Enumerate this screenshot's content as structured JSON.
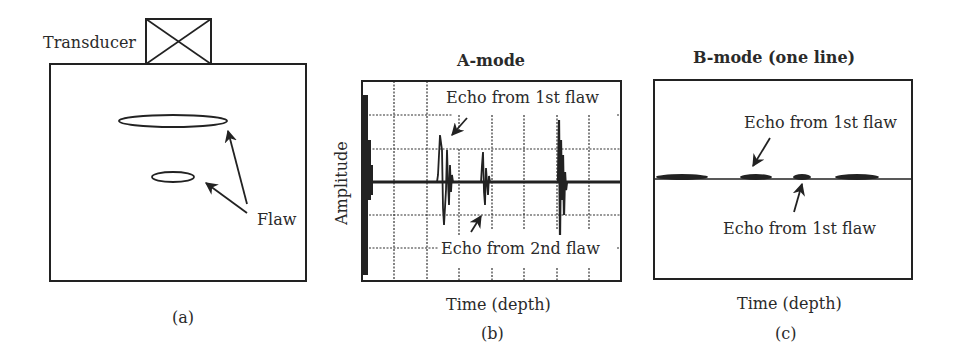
{
  "figure": {
    "panels": [
      {
        "id": "a",
        "caption": "(a)",
        "labels": {
          "transducer": "Transducer",
          "flaw": "Flaw"
        },
        "flaws": [
          {
            "name": "1st flaw",
            "shape": "ellipse",
            "cx": 173,
            "cy": 121,
            "rx": 54,
            "ry": 6
          },
          {
            "name": "2nd flaw",
            "shape": "ellipse",
            "cx": 173,
            "cy": 177,
            "rx": 21,
            "ry": 5
          }
        ]
      },
      {
        "id": "b",
        "caption": "(b)",
        "title": "A-mode",
        "ylabel": "Amplitude",
        "xlabel": "Time (depth)",
        "annotations": {
          "echo1": "Echo from 1st flaw",
          "echo2": "Echo from 2nd flaw"
        }
      },
      {
        "id": "c",
        "caption": "(c)",
        "title": "B-mode (one line)",
        "xlabel": "Time (depth)",
        "annotations": {
          "echo_top": "Echo from 1st flaw",
          "echo_bottom": "Echo from 1st flaw"
        }
      }
    ],
    "colors": {
      "ink": "#222222",
      "background": "#ffffff"
    }
  }
}
